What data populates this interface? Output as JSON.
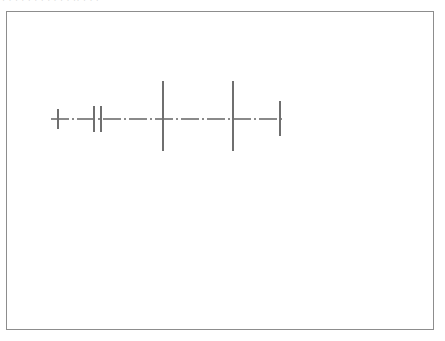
{
  "document": {
    "title": "Technical Centerline Drawing",
    "top_edge_artifact_text": "· · ·   · ·  · · ·    ·   · ·      ·· ·        · ·",
    "background_color": "#ffffff"
  },
  "frame": {
    "name": "drawing-border",
    "x": 6,
    "y": 11,
    "width": 428,
    "height": 319,
    "stroke_color": "#8d8d8d",
    "stroke_width": 1,
    "fill_color": "#ffffff"
  },
  "chart_data": {
    "type": "line",
    "title": "",
    "subtitle": "",
    "xlabel": "",
    "ylabel": "",
    "grid": false,
    "legend_position": "none",
    "axis_style": "dash-dot centerline",
    "axis_color": "#8a8a8a",
    "tick_color": "#6f6f6f",
    "xlim": [
      44,
      277
    ],
    "ylim": [
      69,
      139
    ],
    "centerline": {
      "name": "horizontal-centerline",
      "y": 107,
      "x_start": 44,
      "x_end": 277,
      "dash_pattern": "18 3 2 3",
      "stroke_width": 1.1,
      "color": "#8a8a8a"
    },
    "ticks": [
      {
        "label": "tick-1",
        "x": 51,
        "y_top": 97,
        "y_bottom": 117,
        "height": 20,
        "stroke_width": 1.1,
        "color": "#6f6f6f"
      },
      {
        "label": "tick-2",
        "x": 87,
        "y_top": 94,
        "y_bottom": 120,
        "height": 26,
        "stroke_width": 1.1,
        "color": "#6f6f6f"
      },
      {
        "label": "tick-3",
        "x": 94,
        "y_top": 94,
        "y_bottom": 120,
        "height": 26,
        "stroke_width": 1.1,
        "color": "#6f6f6f"
      },
      {
        "label": "tick-4",
        "x": 156,
        "y_top": 69,
        "y_bottom": 139,
        "height": 70,
        "stroke_width": 1.1,
        "color": "#6f6f6f"
      },
      {
        "label": "tick-5",
        "x": 226,
        "y_top": 69,
        "y_bottom": 139,
        "height": 70,
        "stroke_width": 1.1,
        "color": "#6f6f6f"
      },
      {
        "label": "tick-6",
        "x": 273,
        "y_top": 89,
        "y_bottom": 124,
        "height": 35,
        "stroke_width": 1.1,
        "color": "#6f6f6f"
      }
    ],
    "categories": [
      "tick-1",
      "tick-2",
      "tick-3",
      "tick-4",
      "tick-5",
      "tick-6"
    ],
    "x": [
      51,
      87,
      94,
      156,
      226,
      273
    ],
    "values": [
      20,
      26,
      26,
      70,
      70,
      35
    ]
  }
}
